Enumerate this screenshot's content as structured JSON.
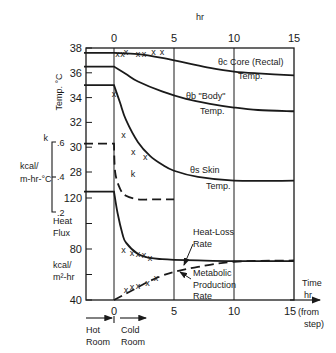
{
  "chart_data": {
    "type": "line",
    "title": "",
    "x_axis": {
      "top_label": "hr",
      "bottom_label_lines": [
        "Time",
        "hr"
      ],
      "ticks": [
        "0",
        "5",
        "10",
        "15"
      ],
      "last_tick_suffix_lines": [
        "(from",
        "step)"
      ],
      "range": [
        -2.5,
        15
      ]
    },
    "phases": {
      "before": "Hot Room",
      "after": "Cold Room",
      "before_lines": [
        "Hot",
        "Room"
      ],
      "after_lines": [
        "Cold",
        "Room"
      ]
    },
    "panels": [
      {
        "name": "temperature",
        "ylabel": "Temp. °C",
        "ticks": [
          "38",
          "36",
          "34",
          "32",
          "30",
          "28"
        ],
        "ylim": [
          27,
          38
        ]
      },
      {
        "name": "conductance",
        "ylabel_lines": [
          "kcal/",
          "m-hr-°C"
        ],
        "symbol": "k",
        "ticks": [
          ".6",
          ".4",
          ".2"
        ],
        "ylim": [
          0.2,
          0.6
        ]
      },
      {
        "name": "heat_flux",
        "ylabel_lines": [
          "Heat",
          "Flux"
        ],
        "unit_lines": [
          "kcal/",
          "m²-hr"
        ],
        "ticks": [
          "120",
          "80",
          "40"
        ],
        "ylim": [
          40,
          125
        ]
      }
    ],
    "series": [
      {
        "name": "θc Core (Rectal) Temp.",
        "label_lines": [
          "θc  Core (Rectal)",
          "Temp."
        ],
        "style": "solid",
        "x": [
          -2.5,
          0,
          2,
          4,
          6,
          8,
          10,
          12,
          15
        ],
        "values": [
          37.6,
          37.6,
          37.5,
          37.2,
          36.8,
          36.4,
          36.1,
          35.95,
          35.8
        ]
      },
      {
        "name": "θb \"Body\" Temp.",
        "label_lines": [
          "θb  \"Body\"",
          "Temp."
        ],
        "style": "solid",
        "x": [
          -2.5,
          0,
          1,
          2,
          4,
          6,
          8,
          10,
          12,
          15
        ],
        "values": [
          36.5,
          36.5,
          35.9,
          35.3,
          34.5,
          33.9,
          33.5,
          33.2,
          33.0,
          32.9
        ]
      },
      {
        "name": "θs Skin Temp.",
        "label_lines": [
          "θs  Skin",
          "Temp."
        ],
        "style": "solid",
        "x": [
          -2.5,
          0,
          0.5,
          1,
          2,
          3,
          4,
          5,
          7,
          10,
          15
        ],
        "values": [
          35.0,
          35.0,
          33.6,
          32.2,
          30.4,
          29.3,
          28.6,
          28.1,
          27.6,
          27.3,
          27.3
        ]
      },
      {
        "name": "k",
        "label_lines": [
          "k"
        ],
        "style": "dashed",
        "x": [
          -2.5,
          0,
          0.1,
          0.5,
          1,
          2,
          3,
          4,
          5
        ],
        "values": [
          0.58,
          0.58,
          0.42,
          0.33,
          0.29,
          0.27,
          0.27,
          0.27,
          0.27
        ]
      },
      {
        "name": "Heat-Loss Rate",
        "label_lines": [
          "Heat-Loss",
          "Rate"
        ],
        "style": "solid",
        "x": [
          -2.5,
          0,
          0.3,
          0.7,
          1,
          2,
          3,
          4,
          5,
          7,
          10,
          15
        ],
        "values": [
          125,
          125,
          108,
          92,
          85,
          76,
          73,
          72,
          71.5,
          71,
          70.5,
          70.5
        ]
      },
      {
        "name": "Metabolic Production Rate",
        "label_lines": [
          "Metabolic",
          "Production",
          "Rate"
        ],
        "style": "dashed",
        "x": [
          0,
          1,
          2,
          3,
          4,
          5,
          7,
          10,
          15
        ],
        "values": [
          40,
          45,
          50,
          55,
          59,
          62,
          66,
          70,
          71
        ]
      },
      {
        "name": "core observations",
        "style": "markers",
        "marker": "x",
        "x": [
          0.3,
          0.7,
          1.0,
          2.0,
          2.5,
          3.3,
          4.0
        ],
        "values": [
          37.5,
          37.5,
          37.7,
          37.5,
          37.5,
          37.7,
          37.7
        ]
      },
      {
        "name": "skin observations",
        "style": "markers",
        "marker": "x",
        "x": [
          0.0,
          0.8,
          1.6,
          2.6
        ],
        "values": [
          34.3,
          31.0,
          29.6,
          29.2
        ]
      },
      {
        "name": "heat loss observations",
        "style": "markers",
        "marker": "x",
        "x": [
          0.8,
          1.5,
          2.0,
          2.5,
          3.0
        ],
        "values": [
          79,
          77,
          76,
          75,
          73
        ]
      },
      {
        "name": "metabolic observations",
        "style": "markers",
        "marker": "x",
        "x": [
          1.0,
          1.5,
          2.0,
          2.8,
          3.5
        ],
        "values": [
          48,
          50,
          51,
          53,
          57
        ]
      }
    ],
    "grid": {
      "vertical_lines_at": [
        0,
        5,
        10,
        15
      ]
    },
    "legend": "inline labels"
  }
}
